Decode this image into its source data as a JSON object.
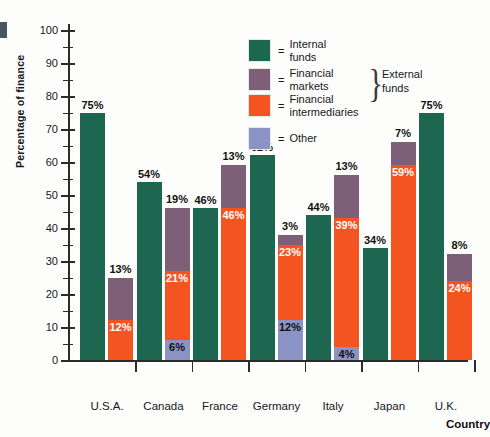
{
  "chart_data": {
    "type": "bar",
    "title": "",
    "xlabel": "Country",
    "ylabel": "Percentage of finance",
    "ylim": [
      0,
      100
    ],
    "yticks": [
      0,
      10,
      20,
      30,
      40,
      50,
      60,
      70,
      80,
      90,
      100
    ],
    "grid": false,
    "legend_position": "top-right",
    "categories": [
      "U.S.A.",
      "Canada",
      "France",
      "Germany",
      "Italy",
      "Japan",
      "U.K."
    ],
    "legend": [
      {
        "key": "internal",
        "label": "Internal funds",
        "color": "#1d6650"
      },
      {
        "key": "markets",
        "label": "Financial markets",
        "color": "#7d5f77"
      },
      {
        "key": "intermediaries",
        "label": "Financial\nintermediaries",
        "color": "#f4541f"
      },
      {
        "key": "other",
        "label": "Other",
        "color": "#8b93c4"
      }
    ],
    "legend_eq": "=",
    "legend_bracket_label": "External\nfunds",
    "series": [
      {
        "name": "Internal funds",
        "color": "#1d6650",
        "values": [
          75,
          54,
          46,
          62,
          44,
          34,
          75
        ]
      },
      {
        "name": "Financial markets",
        "color": "#7d5f77",
        "values": [
          13,
          19,
          13,
          3,
          13,
          7,
          8
        ]
      },
      {
        "name": "Financial intermediaries",
        "color": "#f4541f",
        "values": [
          12,
          21,
          46,
          23,
          39,
          59,
          24
        ]
      },
      {
        "name": "Other",
        "color": "#8b93c4",
        "values": [
          0,
          6,
          -5,
          12,
          4,
          0,
          -7
        ]
      }
    ],
    "groups": [
      {
        "country": "U.S.A.",
        "internal": {
          "value": 75,
          "label": "75%"
        },
        "external_total": 25,
        "external_stack": [
          {
            "key": "intermediaries",
            "value": 12,
            "label": "12%"
          },
          {
            "key": "markets",
            "value": 13,
            "label": "13%"
          }
        ]
      },
      {
        "country": "Canada",
        "internal": {
          "value": 54,
          "label": "54%"
        },
        "external_total": 46,
        "external_stack": [
          {
            "key": "other",
            "value": 6,
            "label": "6%"
          },
          {
            "key": "intermediaries",
            "value": 21,
            "label": "21%"
          },
          {
            "key": "markets",
            "value": 19,
            "label": "19%"
          }
        ]
      },
      {
        "country": "France",
        "internal": {
          "value": 46,
          "label": "46%"
        },
        "external_total": 59,
        "external_stack": [
          {
            "key": "other",
            "value": -5,
            "label": "–5%"
          },
          {
            "key": "intermediaries",
            "value": 46,
            "label": "46%"
          },
          {
            "key": "markets",
            "value": 13,
            "label": "13%"
          }
        ]
      },
      {
        "country": "Germany",
        "internal": {
          "value": 62,
          "label": "62%"
        },
        "external_total": 38,
        "external_stack": [
          {
            "key": "other",
            "value": 12,
            "label": "12%"
          },
          {
            "key": "intermediaries",
            "value": 23,
            "label": "23%"
          },
          {
            "key": "markets",
            "value": 3,
            "label": "3%"
          }
        ]
      },
      {
        "country": "Italy",
        "internal": {
          "value": 44,
          "label": "44%"
        },
        "external_total": 56,
        "external_stack": [
          {
            "key": "other",
            "value": 4,
            "label": "4%"
          },
          {
            "key": "intermediaries",
            "value": 39,
            "label": "39%"
          },
          {
            "key": "markets",
            "value": 13,
            "label": "13%"
          }
        ]
      },
      {
        "country": "Japan",
        "internal": {
          "value": 34,
          "label": "34%"
        },
        "external_total": 66,
        "external_stack": [
          {
            "key": "intermediaries",
            "value": 59,
            "label": "59%"
          },
          {
            "key": "markets",
            "value": 7,
            "label": "7%"
          }
        ]
      },
      {
        "country": "U.K.",
        "internal": {
          "value": 75,
          "label": "75%"
        },
        "external_total": 32,
        "external_stack": [
          {
            "key": "other",
            "value": -7,
            "label": "–7%"
          },
          {
            "key": "intermediaries",
            "value": 24,
            "label": "24%"
          },
          {
            "key": "markets",
            "value": 8,
            "label": "8%"
          }
        ]
      }
    ]
  }
}
